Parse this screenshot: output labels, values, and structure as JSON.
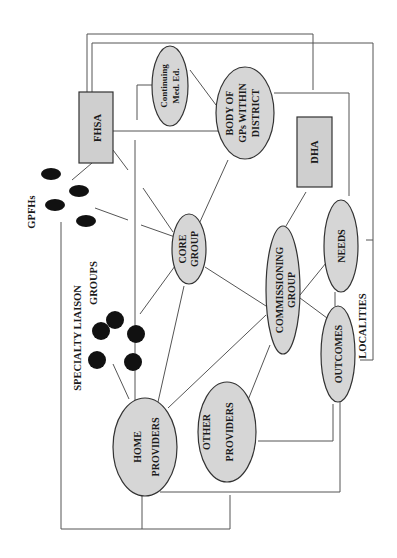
{
  "diagram": {
    "orientation": "rotated 90 degrees counter-clockwise",
    "colors": {
      "node_fill": "#d6d6d6",
      "box_fill": "#cfcfcf",
      "outline": "#333333",
      "connector": "#555555",
      "dot": "#111111"
    },
    "nodes": {
      "fhsa": "FHSA",
      "dha": "DHA",
      "continuing_line1": "Continuing",
      "continuing_line2": "Med. Ed.",
      "body_line1": "BODY OF",
      "body_line2": "GPs WITHIN",
      "body_line3": "DISTRICT",
      "core_line1": "CORE",
      "core_line2": "GROUP",
      "commissioning_line1": "COMMISSIONING",
      "commissioning_line2": "GROUP",
      "needs": "NEEDS",
      "outcomes": "OUTCOMES",
      "home_line1": "HOME",
      "home_line2": "PROVIDERS",
      "other_line1": "OTHER",
      "other_line2": "PROVIDERS"
    },
    "labels": {
      "gpfhs": "GPFHs",
      "specialty_line1": "SPECIALTY  LIAISON",
      "specialty_line2": "GROUPS",
      "localities": "LOCALITIES"
    },
    "edges": [
      [
        "FHSA",
        "GPFHs"
      ],
      [
        "FHSA",
        "CORE GROUP"
      ],
      [
        "GPFHs",
        "CORE GROUP"
      ],
      [
        "SPECIALTY LIAISON GROUPS",
        "CORE GROUP"
      ],
      [
        "SPECIALTY LIAISON GROUPS",
        "HOME PROVIDERS"
      ],
      [
        "CORE GROUP",
        "BODY OF GPs WITHIN DISTRICT"
      ],
      [
        "CORE GROUP",
        "HOME PROVIDERS"
      ],
      [
        "CORE GROUP",
        "COMMISSIONING GROUP"
      ],
      [
        "Continuing Med. Ed.",
        "BODY OF GPs WITHIN DISTRICT"
      ],
      [
        "COMMISSIONING GROUP",
        "DHA"
      ],
      [
        "COMMISSIONING GROUP",
        "NEEDS"
      ],
      [
        "COMMISSIONING GROUP",
        "OUTCOMES"
      ],
      [
        "COMMISSIONING GROUP",
        "HOME PROVIDERS"
      ],
      [
        "COMMISSIONING GROUP",
        "OTHER PROVIDERS"
      ],
      [
        "NEEDS",
        "OUTCOMES"
      ],
      [
        "BODY OF GPs WITHIN DISTRICT",
        "DHA"
      ]
    ]
  }
}
